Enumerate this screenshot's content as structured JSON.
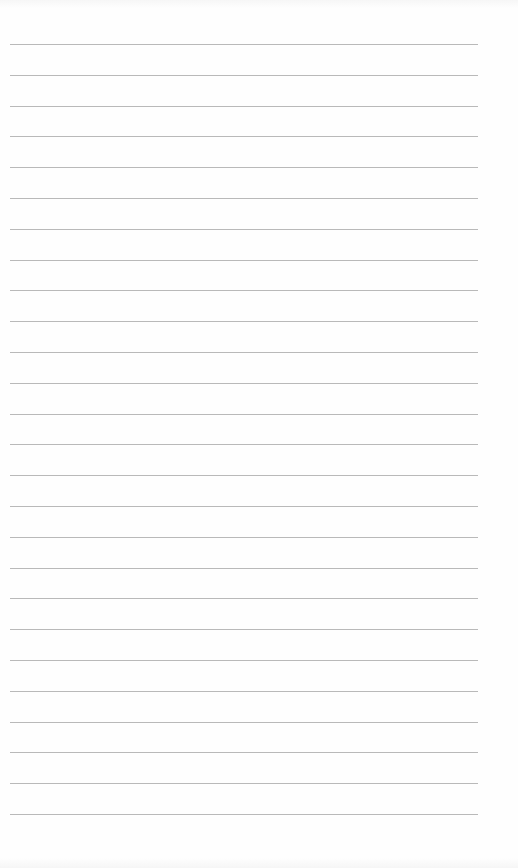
{
  "page": {
    "type": "lined-paper",
    "background_color": "#fefefe",
    "line_color": "#b9b9b9",
    "line_count": 26,
    "first_line_y": 44,
    "line_spacing": 30.8,
    "line_left": 10,
    "line_width": 468
  }
}
